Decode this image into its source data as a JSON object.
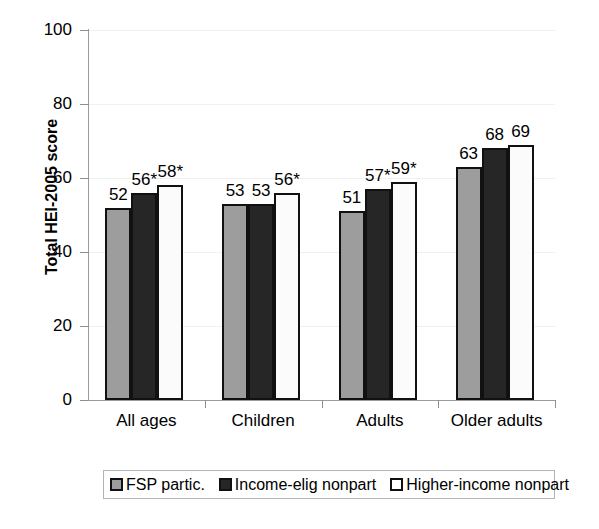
{
  "chart_data": {
    "type": "bar",
    "title": "",
    "xlabel": "",
    "ylabel": "Total HEI-2005 score",
    "ylim": [
      0,
      100
    ],
    "yticks": [
      0,
      20,
      40,
      60,
      80,
      100
    ],
    "ytick_labels": [
      "0",
      "20",
      "40",
      "60",
      "80",
      "100"
    ],
    "grid": true,
    "legend_position": "bottom",
    "categories": [
      "All ages",
      "Children",
      "Adults",
      "Older adults"
    ],
    "series": [
      {
        "name": "FSP partic.",
        "color": "#9d9d9d",
        "values": [
          52,
          53,
          51,
          63
        ],
        "labels": [
          "52",
          "53",
          "51",
          "63"
        ]
      },
      {
        "name": "Income-elig nonpart",
        "color": "#262626",
        "values": [
          56,
          53,
          57,
          68
        ],
        "labels": [
          "56*",
          "53",
          "57*",
          "68"
        ]
      },
      {
        "name": "Higher-income nonpart",
        "color": "#ffffff",
        "values": [
          58,
          56,
          59,
          69
        ],
        "labels": [
          "58*",
          "56*",
          "59*",
          "69"
        ]
      }
    ],
    "annotations": [
      "* denotes statistically significant difference from FSP participants"
    ]
  },
  "legend": {
    "items": [
      {
        "label": "FSP partic."
      },
      {
        "label": "Income-elig nonpart"
      },
      {
        "label": "Higher-income nonpart"
      }
    ]
  },
  "axis": {
    "y_title": "Total HEI-2005 score"
  }
}
